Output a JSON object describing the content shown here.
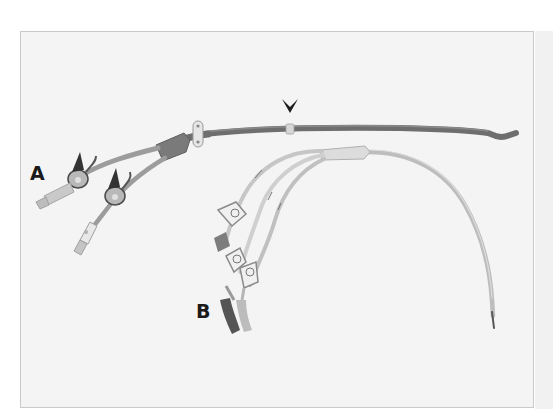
{
  "figure": {
    "labels": {
      "a": "A",
      "b": "B"
    },
    "marker": "arrowhead-marker",
    "colors": {
      "background": "#ffffff",
      "panel": "#f4f4f4",
      "panel_border": "#c9c9c9",
      "catheter_a_shaft": "#6e6e6e",
      "catheter_a_hub": "#7a7a7a",
      "catheter_b_shaft": "#cfcfcf",
      "label": "#1a1a1a"
    }
  }
}
